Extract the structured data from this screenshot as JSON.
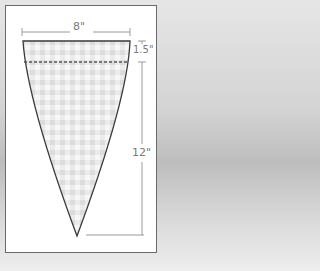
{
  "diagram": {
    "shape": "inverted-triangle pennant with gingham fill",
    "dimensions": {
      "width_label": "8\"",
      "hem_label": "1.5\"",
      "height_label": "12\""
    },
    "colors": {
      "outline": "#3a3a3a",
      "dim_line": "#9a9a9a",
      "gingham_light": "#f4f4f4",
      "gingham_mid": "#e2e2e2",
      "frame_border": "#6a6a6a"
    },
    "fold_line": "dashed"
  }
}
